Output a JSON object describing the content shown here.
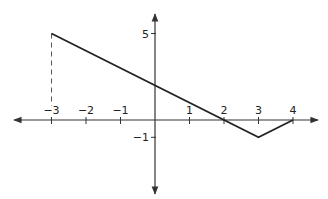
{
  "chart_data": {
    "type": "line",
    "title": "",
    "xlabel": "",
    "ylabel": "",
    "x_ticks": [
      -3,
      -2,
      -1,
      1,
      2,
      3,
      4
    ],
    "x_tick_labels": [
      "−3",
      "−2",
      "−1",
      "1",
      "2",
      "3",
      "4"
    ],
    "y_ticks": [
      5,
      -1
    ],
    "y_tick_labels": [
      "5",
      "−1"
    ],
    "xlim": [
      -4.2,
      4.5
    ],
    "ylim": [
      -3.5,
      6.5
    ],
    "grid": false,
    "legend": null,
    "series": [
      {
        "name": "f(x)",
        "points": [
          [
            -3,
            5
          ],
          [
            3,
            -1
          ],
          [
            4,
            0
          ]
        ],
        "color": "#222222"
      }
    ],
    "annotations": [
      {
        "type": "dashed-vertical",
        "x": -3,
        "from_y": 0,
        "to_y": 5
      }
    ]
  },
  "axes": {
    "color": "#333333",
    "line_color": "#222222"
  }
}
